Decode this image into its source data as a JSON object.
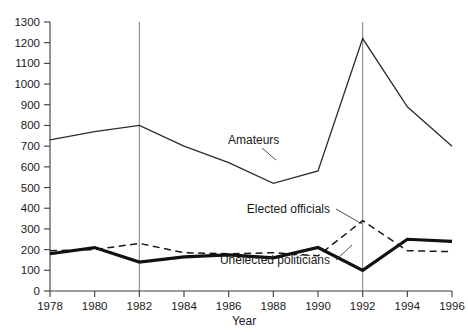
{
  "chart_data": {
    "type": "line",
    "title": "",
    "xlabel": "Year",
    "ylabel": "",
    "x": [
      1978,
      1980,
      1982,
      1984,
      1986,
      1988,
      1990,
      1992,
      1994,
      1996
    ],
    "xlim": [
      1978,
      1996
    ],
    "ylim": [
      0,
      1300
    ],
    "grid": false,
    "legend_position": "inline-annotations",
    "x_tick_labels": [
      "1978",
      "1980",
      "1982",
      "1984",
      "1986",
      "1988",
      "1990",
      "1992",
      "1994",
      "1996"
    ],
    "y_tick_labels": [
      "0",
      "100",
      "200",
      "300",
      "400",
      "500",
      "600",
      "700",
      "800",
      "900",
      "1000",
      "1100",
      "1200",
      "1300"
    ],
    "y_ticks": [
      0,
      100,
      200,
      300,
      400,
      500,
      600,
      700,
      800,
      900,
      1000,
      1100,
      1200,
      1300
    ],
    "reference_lines": [
      {
        "x": 1982,
        "orientation": "vertical",
        "y_top": 1300
      },
      {
        "x": 1992,
        "orientation": "vertical",
        "y_top": 1300
      }
    ],
    "series": [
      {
        "name": "Amateurs",
        "style": "thin-solid",
        "values": [
          730,
          770,
          800,
          700,
          620,
          520,
          580,
          1220,
          890,
          700
        ]
      },
      {
        "name": "Elected officials",
        "style": "dashed",
        "values": [
          195,
          200,
          230,
          185,
          180,
          185,
          170,
          340,
          195,
          190
        ]
      },
      {
        "name": "Unelected politicians",
        "style": "thick-solid",
        "values": [
          180,
          210,
          140,
          165,
          175,
          160,
          210,
          100,
          250,
          240
        ]
      }
    ],
    "annotations": [
      {
        "text": "Amateurs",
        "for_series": "Amateurs"
      },
      {
        "text": "Elected officials",
        "for_series": "Elected officials"
      },
      {
        "text": "Unelected politicians",
        "for_series": "Unelected politicians"
      }
    ]
  }
}
